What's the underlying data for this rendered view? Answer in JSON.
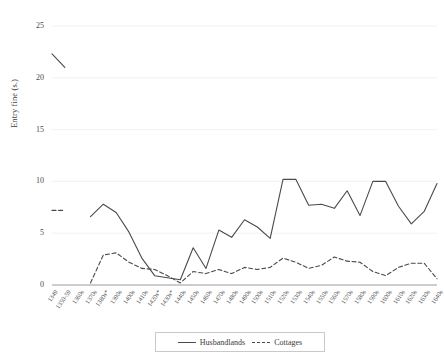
{
  "chart_data": {
    "type": "line",
    "title": "",
    "xlabel": "",
    "ylabel": "Entry fine (s.)",
    "ylim": [
      0,
      25
    ],
    "yticks": [
      0,
      5,
      10,
      15,
      20,
      25
    ],
    "grid": true,
    "legend_position": "bottom",
    "categories": [
      "1349",
      "1350-59",
      "1360s",
      "1370s",
      "1380s*",
      "1390s",
      "1400s",
      "1410s",
      "1420s*",
      "1430s*",
      "1440s",
      "1450s",
      "1460s",
      "1470s",
      "1480s",
      "1490s",
      "1500s",
      "1510s",
      "1520s",
      "1530s",
      "1540s",
      "1550s",
      "1560s",
      "1570s",
      "1580s",
      "1590s",
      "1600s",
      "1610s",
      "1620s",
      "1630s",
      "1640s"
    ],
    "series": [
      {
        "name": "Husbandlands",
        "style": "solid",
        "color": "#4a4a4a",
        "values": [
          22.3,
          21.0,
          null,
          6.6,
          7.8,
          7.0,
          5.1,
          2.6,
          0.9,
          0.7,
          0.5,
          3.6,
          1.6,
          5.3,
          4.6,
          6.3,
          5.6,
          4.5,
          10.2,
          10.2,
          7.7,
          7.8,
          7.4,
          9.1,
          6.7,
          10.0,
          10.0,
          7.6,
          5.9,
          7.1,
          9.8
        ]
      },
      {
        "name": "Cottages",
        "style": "dashed",
        "color": "#4a4a4a",
        "values": [
          7.2,
          7.2,
          null,
          0.2,
          2.9,
          3.1,
          2.2,
          1.6,
          1.5,
          0.9,
          0.2,
          1.3,
          1.1,
          1.5,
          1.1,
          1.7,
          1.5,
          1.7,
          2.6,
          2.2,
          1.6,
          1.9,
          2.7,
          2.3,
          2.2,
          1.3,
          0.9,
          1.7,
          2.1,
          2.1,
          0.6
        ]
      }
    ]
  },
  "legend": {
    "items": [
      {
        "label": "Husbandlands",
        "style": "solid"
      },
      {
        "label": "Cottages",
        "style": "dashed"
      }
    ]
  }
}
